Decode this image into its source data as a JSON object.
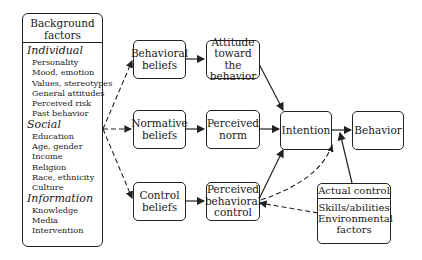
{
  "background_factors": {
    "title_line1": "Background",
    "title_line2": "factors",
    "categories": [
      {
        "name": "Individual",
        "items": [
          "Personality",
          "Mood, emotion",
          "Values, stereotypes",
          "General attitudes",
          "Perceived risk",
          "Past behavior"
        ]
      },
      {
        "name": "Social",
        "items": [
          "Education",
          "Age, gender",
          "Income",
          "Religion",
          "Race, ethnicity",
          "Culture"
        ]
      },
      {
        "name": "Information",
        "items": [
          "Knowledge",
          "Media",
          "Intervention"
        ]
      }
    ]
  },
  "nodes": {
    "behavioral_beliefs": {
      "line1": "Behavioral",
      "line2": "beliefs"
    },
    "normative_beliefs": {
      "line1": "Normative",
      "line2": "beliefs"
    },
    "control_beliefs": {
      "line1": "Control",
      "line2": "beliefs"
    },
    "attitude": {
      "line1": "Attitude",
      "line2": "toward the",
      "line3": "behavior"
    },
    "perceived_norm": {
      "line1": "Perceived",
      "line2": "norm"
    },
    "perceived_control": {
      "line1": "Perceived",
      "line2": "behavioral",
      "line3": "control"
    },
    "intention": {
      "label": "Intention"
    },
    "behavior": {
      "label": "Behavior"
    },
    "actual_control": {
      "title": "Actual control",
      "line1": "Skills/abilities",
      "line2": "Environmental",
      "line3": "factors"
    }
  },
  "colors": {
    "stroke": "#222222",
    "background": "#ffffff"
  }
}
